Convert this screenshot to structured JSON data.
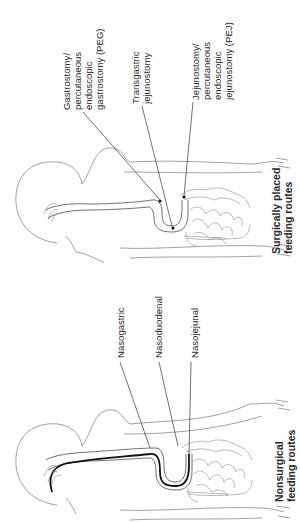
{
  "figure": {
    "orientation": "rotated 90° counter-clockwise",
    "panels": [
      {
        "id": "surgical",
        "caption_line1": "Surgically placed",
        "caption_line2": "feeding routes",
        "labels": [
          {
            "id": "peg",
            "lines": [
              "Gastrostomy/",
              "percutaneous",
              "endoscopic",
              "gastrostomy (PEG)"
            ]
          },
          {
            "id": "transgastric",
            "lines": [
              "Transgastric",
              "jejunostomy"
            ]
          },
          {
            "id": "pej",
            "lines": [
              "Jejunostomy/",
              "percutaneous",
              "endoscopic",
              "jejunostomy (PEJ)"
            ]
          }
        ]
      },
      {
        "id": "nonsurgical",
        "caption_line1": "Nonsurgical",
        "caption_line2": "feeding routes",
        "labels": [
          {
            "id": "nasogastric",
            "lines": [
              "Nasogastric"
            ]
          },
          {
            "id": "nasoduodenal",
            "lines": [
              "Nasoduodenal"
            ]
          },
          {
            "id": "nasojejunal",
            "lines": [
              "Nasojejunal"
            ]
          }
        ]
      }
    ],
    "colors": {
      "background": "#ffffff",
      "outline": "#7a7a7a",
      "tube": "#111111",
      "text": "#2a2a2a"
    }
  }
}
